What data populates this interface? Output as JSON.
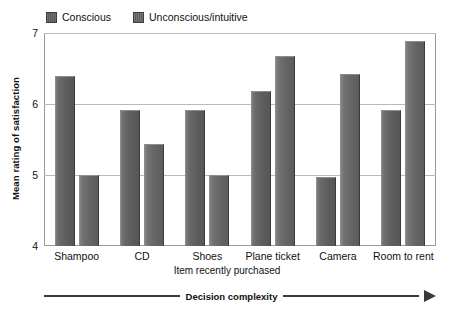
{
  "chart_data": {
    "type": "bar",
    "title": "",
    "subtitle": "",
    "xlabel": "Item recently purchased",
    "ylabel": "Mean rating of satisfaction",
    "categories": [
      "Shampoo",
      "CD",
      "Shoes",
      "Plane ticket",
      "Camera",
      "Room to rent"
    ],
    "series": [
      {
        "name": "Conscious",
        "values": [
          6.4,
          5.92,
          5.92,
          6.18,
          4.97,
          5.92
        ],
        "color": "#616161"
      },
      {
        "name": "Unconscious/intuitive",
        "values": [
          5.0,
          5.44,
          5.0,
          6.67,
          6.42,
          6.89
        ],
        "color": "#6a6a6a"
      }
    ],
    "ylim": [
      4,
      7
    ],
    "yticks": [
      4,
      5,
      6,
      7
    ],
    "ytick_labels": [
      "4",
      "5",
      "6",
      "7"
    ],
    "grid": true,
    "grid_axis": "y",
    "legend_position": "top-left",
    "annotations": [
      {
        "text": "Decision complexity",
        "type": "arrow-axis",
        "direction": "right",
        "position": "below-axis"
      }
    ]
  },
  "legend": {
    "entries": [
      {
        "label": "Conscious"
      },
      {
        "label": "Unconscious/intuitive"
      }
    ]
  },
  "axes": {
    "y_title": "Mean rating of satisfaction",
    "x_title": "Item recently purchased",
    "y_ticks": [
      "7",
      "6",
      "5",
      "4"
    ]
  },
  "annotation": {
    "complexity_label": "Decision complexity"
  }
}
